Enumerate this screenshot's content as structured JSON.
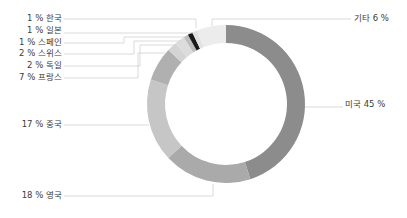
{
  "chart_data": {
    "type": "pie",
    "variant": "donut",
    "title": "",
    "start_angle_deg": 0,
    "direction": "clockwise",
    "center": [
      226,
      104
    ],
    "outer_radius": 79,
    "inner_radius": 61,
    "slices": [
      {
        "label": "미국",
        "value": 45,
        "color": "#8c8c8c",
        "text": "미국 45 %",
        "side": "right",
        "label_x": 345,
        "label_y": 107,
        "line": [
          [
            305,
            107
          ],
          [
            343,
            107
          ]
        ]
      },
      {
        "label": "영국",
        "value": 18,
        "color": "#aaaaaa",
        "text": "18 % 영국",
        "side": "left",
        "label_x": 62,
        "label_y": 198,
        "line": [
          [
            213,
            184
          ],
          [
            213,
            196
          ],
          [
            64,
            196
          ]
        ]
      },
      {
        "label": "중국",
        "value": 17,
        "color": "#c6c6c6",
        "text": "17 % 중국",
        "side": "left",
        "label_x": 62,
        "label_y": 127,
        "line": [
          [
            149,
            125
          ],
          [
            64,
            125
          ]
        ]
      },
      {
        "label": "프랑스",
        "value": 7,
        "color": "#b0b0b0",
        "text": "7 % 프랑스",
        "side": "left",
        "label_x": 62,
        "label_y": 80,
        "line": [
          [
            165,
            53
          ],
          [
            138,
            53
          ],
          [
            138,
            78
          ],
          [
            64,
            78
          ]
        ]
      },
      {
        "label": "독일",
        "value": 2,
        "color": "#d4d4d4",
        "text": "2 % 독일",
        "side": "left",
        "label_x": 62,
        "label_y": 68,
        "line": [
          [
            175,
            45
          ],
          [
            140,
            45
          ],
          [
            140,
            66
          ],
          [
            64,
            66
          ]
        ]
      },
      {
        "label": "스위스",
        "value": 2,
        "color": "#dcdcdc",
        "text": "2 % 스위스",
        "side": "left",
        "label_x": 62,
        "label_y": 56,
        "line": [
          [
            180,
            41
          ],
          [
            134,
            41
          ],
          [
            134,
            54
          ],
          [
            64,
            54
          ]
        ]
      },
      {
        "label": "스페인",
        "value": 1,
        "color": "#bdbdbd",
        "text": "1 % 스페인",
        "side": "left",
        "label_x": 62,
        "label_y": 45,
        "line": [
          [
            186,
            37
          ],
          [
            124,
            37
          ],
          [
            124,
            43
          ],
          [
            64,
            43
          ]
        ]
      },
      {
        "label": "일본",
        "value": 1,
        "color": "#1a1a1a",
        "text": "1 % 일본",
        "side": "left",
        "label_x": 62,
        "label_y": 33,
        "line": [
          [
            193,
            33
          ],
          [
            64,
            33
          ]
        ]
      },
      {
        "label": "한국",
        "value": 1,
        "color": "#e2e2e2",
        "text": "1 % 한국",
        "side": "left",
        "label_x": 62,
        "label_y": 21,
        "line": [
          [
            196,
            28
          ],
          [
            196,
            19
          ],
          [
            64,
            19
          ]
        ]
      },
      {
        "label": "기타",
        "value": 6,
        "color": "#ececec",
        "text": "기타 6 %",
        "side": "right",
        "label_x": 354,
        "label_y": 21,
        "line": [
          [
            212,
            26
          ],
          [
            212,
            19
          ],
          [
            351,
            19
          ]
        ]
      }
    ],
    "legend": "none",
    "grid": false
  }
}
